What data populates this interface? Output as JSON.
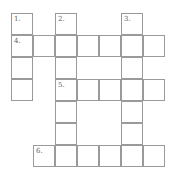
{
  "crossword": {
    "cell_size": 22,
    "origin": {
      "x": 11,
      "y": 13
    },
    "border_color": "#9a9a9a",
    "cells": [
      {
        "r": 0,
        "c": 0,
        "num": "1."
      },
      {
        "r": 0,
        "c": 2,
        "num": "2."
      },
      {
        "r": 0,
        "c": 5,
        "num": "3."
      },
      {
        "r": 1,
        "c": 0,
        "num": "4."
      },
      {
        "r": 1,
        "c": 1
      },
      {
        "r": 1,
        "c": 2
      },
      {
        "r": 1,
        "c": 3
      },
      {
        "r": 1,
        "c": 4
      },
      {
        "r": 1,
        "c": 5
      },
      {
        "r": 1,
        "c": 6
      },
      {
        "r": 2,
        "c": 0
      },
      {
        "r": 2,
        "c": 2
      },
      {
        "r": 2,
        "c": 5
      },
      {
        "r": 3,
        "c": 0
      },
      {
        "r": 3,
        "c": 2,
        "num": "5."
      },
      {
        "r": 3,
        "c": 3
      },
      {
        "r": 3,
        "c": 4
      },
      {
        "r": 3,
        "c": 5
      },
      {
        "r": 3,
        "c": 6
      },
      {
        "r": 4,
        "c": 2
      },
      {
        "r": 4,
        "c": 5
      },
      {
        "r": 5,
        "c": 2
      },
      {
        "r": 5,
        "c": 5
      },
      {
        "r": 6,
        "c": 1,
        "num": "6."
      },
      {
        "r": 6,
        "c": 2
      },
      {
        "r": 6,
        "c": 3
      },
      {
        "r": 6,
        "c": 4
      },
      {
        "r": 6,
        "c": 5
      },
      {
        "r": 6,
        "c": 6
      }
    ]
  }
}
